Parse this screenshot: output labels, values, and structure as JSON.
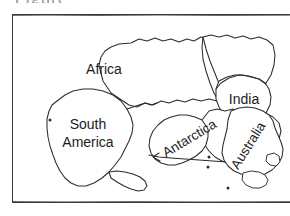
{
  "figure": {
    "type": "supercontinent-reconstruction-map",
    "caption_sliver_text": "Figure",
    "frame": {
      "border_color": "#3a3a3a",
      "background_color": "#ffffff"
    },
    "line_color": "#2d2d2d"
  },
  "labels": {
    "africa": "Africa",
    "india": "India",
    "south_america_line1": "South",
    "south_america_line2": "America",
    "antarctica": "Antarctica",
    "australia": "Australia"
  },
  "landmasses": [
    {
      "name": "Africa",
      "label": "Africa",
      "rotation_deg": 0
    },
    {
      "name": "India",
      "label": "India",
      "rotation_deg": 0
    },
    {
      "name": "South America",
      "label": "South America",
      "rotation_deg": 0
    },
    {
      "name": "Antarctica",
      "label": "Antarctica",
      "rotation_deg": -31
    },
    {
      "name": "Australia",
      "label": "Australia",
      "rotation_deg": -58
    }
  ]
}
